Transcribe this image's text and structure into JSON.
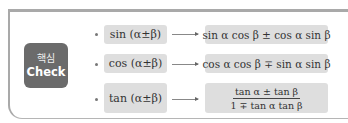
{
  "badge": {
    "korean": "핵심",
    "english": "Check"
  },
  "accent_colors": {
    "badge_bg": "#6b6b6b",
    "box_bg": "#dedede",
    "frame_border": "#a9a9a9"
  },
  "formulas": [
    {
      "left": "sin (α±β)",
      "right": "sin α cos β ± cos α sin β"
    },
    {
      "left": "cos (α±β)",
      "right": "cos α cos β ∓ sin α sin β"
    },
    {
      "left": "tan (α±β)",
      "right_numerator": "tan α ± tan β",
      "right_denominator": "1 ∓ tan α tan β"
    }
  ]
}
